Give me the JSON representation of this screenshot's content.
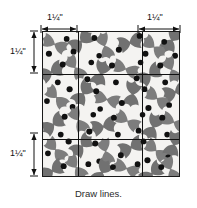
{
  "figure": {
    "type": "quilting-instruction-diagram",
    "caption": "Draw lines.",
    "fabric": {
      "print_name": "holly-leaf-print",
      "background_color": "#f4f3f1",
      "leaf_color": "#7a7a7a",
      "berry_color": "#111111",
      "border_color": "#1a1a1a"
    },
    "grid": {
      "line_color": "#111111",
      "vertical_lines": 2,
      "horizontal_lines": 2,
      "columns": 3,
      "rows": 3
    },
    "dimensions": [
      {
        "id": "top-left",
        "label": "1¼\"",
        "orientation": "horizontal",
        "position": "top-left"
      },
      {
        "id": "top-right",
        "label": "1¼\"",
        "orientation": "horizontal",
        "position": "top-right"
      },
      {
        "id": "left-top",
        "label": "1¼\"",
        "orientation": "vertical",
        "position": "left-upper"
      },
      {
        "id": "left-bottom",
        "label": "1¼\"",
        "orientation": "vertical",
        "position": "left-lower"
      }
    ]
  }
}
